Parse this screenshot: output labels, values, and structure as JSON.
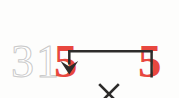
{
  "diagram": {
    "background_color": "#fdfdfc",
    "expression": {
      "multiplicand_faded": "31",
      "multiplicand_faded_digits": [
        "3",
        "1"
      ],
      "units_digit": "5",
      "operator": "×",
      "multiplier": "5",
      "full_text": "315 × 5"
    },
    "colors": {
      "highlight_red": "#e8473f",
      "faded_gray": "#c9c9c9",
      "arrow_dark": "#2e2c2b",
      "operator_dark": "#2b2a29"
    },
    "arrow": {
      "name": "units-digit-pairing-arrow",
      "description": "Elbow arrow from the multiplier 5 up, left, and down into the units digit 5",
      "start_label": "5",
      "end_label": "5",
      "head_direction": "down"
    }
  }
}
